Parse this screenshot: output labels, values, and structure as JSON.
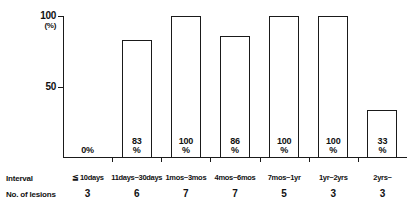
{
  "chart_data": {
    "type": "bar",
    "title": "",
    "xlabel": "Interval",
    "ylabel": "(%)",
    "ylim": [
      0,
      100
    ],
    "yticks": [
      50,
      100
    ],
    "ytick_labels": [
      "50",
      "100"
    ],
    "grid": false,
    "legend": null,
    "categories": [
      "≦ 10days",
      "11days~30days",
      "1mos~3mos",
      "4mos~6mos",
      "7mos~1yr",
      "1yr~2yrs",
      "2yrs~"
    ],
    "values": [
      0,
      83,
      100,
      86,
      100,
      100,
      33
    ],
    "value_labels": [
      "0%",
      "83 %",
      "100 %",
      "86 %",
      "100 %",
      "100 %",
      "33 %"
    ],
    "annotations": {
      "no_of_lesions": [
        3,
        6,
        7,
        7,
        5,
        3,
        3
      ]
    }
  },
  "axis": {
    "y_top_label": "100",
    "y_unit_label": "(%)",
    "y_mid_label": "50"
  },
  "bars": [
    {
      "category": "≦ 10days",
      "percent": 0,
      "value_num": "0",
      "value_pct": "%",
      "lesions": "3",
      "zero": true
    },
    {
      "category": "11days~30days",
      "percent": 83,
      "value_num": "83",
      "value_pct": "%",
      "lesions": "6",
      "zero": false
    },
    {
      "category": "1mos~3mos",
      "percent": 100,
      "value_num": "100",
      "value_pct": "%",
      "lesions": "7",
      "zero": false
    },
    {
      "category": "4mos~6mos",
      "percent": 86,
      "value_num": "86",
      "value_pct": "%",
      "lesions": "7",
      "zero": false
    },
    {
      "category": "7mos~1yr",
      "percent": 100,
      "value_num": "100",
      "value_pct": "%",
      "lesions": "5",
      "zero": false
    },
    {
      "category": "1yr~2yrs",
      "percent": 100,
      "value_num": "100",
      "value_pct": "%",
      "lesions": "3",
      "zero": false
    },
    {
      "category": "2yrs~",
      "percent": 33,
      "value_num": "33",
      "value_pct": "%",
      "lesions": "3",
      "zero": false
    }
  ],
  "table": {
    "interval_row_label": "Interval",
    "lesions_row_label": "No. of lesions"
  },
  "colors": {
    "ink": "#1a1a1a",
    "background": "#ffffff",
    "bar_fill": "#ffffff"
  }
}
